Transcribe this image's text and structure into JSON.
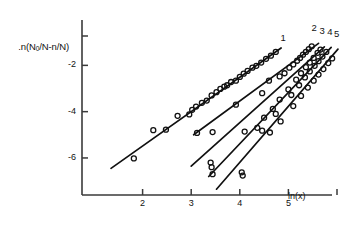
{
  "figure": {
    "background": "#ffffff",
    "ink": "#111111",
    "axis_color": "#3a3a3a"
  },
  "axes": {
    "y_axis_label": ".n(N₀/N-n/N)",
    "y_axis_label_parts": {
      "pre": ".n(N",
      "sub": "0",
      "post": "/N-n/N)"
    },
    "x_axis_label": "ln(x)",
    "y_ticks": [
      "-2",
      "-4",
      "-6"
    ],
    "x_ticks": [
      "2",
      "3",
      "4",
      "5"
    ],
    "xlim": [
      1.0,
      6.0
    ],
    "ylim": [
      -7.6,
      -0.3
    ]
  },
  "curve_labels": [
    "1",
    "2",
    "3",
    "4",
    "5"
  ],
  "chart_data": {
    "type": "scatter",
    "title": "",
    "xlabel": "ln(x)",
    "ylabel": ".n(N0/N-n/N)",
    "xlim": [
      1.0,
      6.0
    ],
    "ylim": [
      -7.6,
      -0.3
    ],
    "grid": false,
    "legend": "curve-end labels 1-5 at upper right",
    "marker": "open-circle",
    "series": [
      {
        "name": "1",
        "fit_line": {
          "x": [
            1.35,
            4.85
          ],
          "y": [
            -6.45,
            -1.25
          ],
          "slope": 1.486,
          "intercept": -8.456
        },
        "label_at": {
          "x": 4.92,
          "y": -0.85
        },
        "points": [
          {
            "x": 1.82,
            "y": -6.02
          },
          {
            "x": 2.22,
            "y": -4.8
          },
          {
            "x": 2.48,
            "y": -4.78
          },
          {
            "x": 2.72,
            "y": -4.18
          },
          {
            "x": 2.96,
            "y": -4.12
          },
          {
            "x": 3.02,
            "y": -3.92
          },
          {
            "x": 3.1,
            "y": -3.78
          },
          {
            "x": 3.22,
            "y": -3.62
          },
          {
            "x": 3.32,
            "y": -3.52
          },
          {
            "x": 3.42,
            "y": -3.3
          },
          {
            "x": 3.52,
            "y": -3.16
          },
          {
            "x": 3.6,
            "y": -3.02
          },
          {
            "x": 3.68,
            "y": -2.92
          },
          {
            "x": 3.74,
            "y": -2.86
          },
          {
            "x": 3.82,
            "y": -2.72
          },
          {
            "x": 3.92,
            "y": -2.66
          },
          {
            "x": 4.0,
            "y": -2.5
          },
          {
            "x": 4.08,
            "y": -2.36
          },
          {
            "x": 4.16,
            "y": -2.24
          },
          {
            "x": 4.26,
            "y": -2.1
          },
          {
            "x": 4.34,
            "y": -2.02
          },
          {
            "x": 4.44,
            "y": -1.88
          },
          {
            "x": 4.54,
            "y": -1.72
          },
          {
            "x": 4.64,
            "y": -1.58
          },
          {
            "x": 4.74,
            "y": -1.42
          }
        ]
      },
      {
        "name": "2",
        "fit_line": {
          "x": [
            3.05,
            5.62
          ],
          "y": [
            -5.0,
            -1.05
          ],
          "slope": 1.537,
          "intercept": -9.688
        },
        "label_at": {
          "x": 5.56,
          "y": -0.42
        },
        "points": [
          {
            "x": 3.12,
            "y": -4.92
          },
          {
            "x": 3.44,
            "y": -4.88
          },
          {
            "x": 3.92,
            "y": -3.7
          },
          {
            "x": 4.46,
            "y": -3.2
          },
          {
            "x": 4.6,
            "y": -2.66
          },
          {
            "x": 4.82,
            "y": -2.48
          },
          {
            "x": 4.92,
            "y": -2.34
          },
          {
            "x": 5.02,
            "y": -2.1
          },
          {
            "x": 5.1,
            "y": -1.96
          },
          {
            "x": 5.18,
            "y": -1.8
          },
          {
            "x": 5.24,
            "y": -1.68
          },
          {
            "x": 5.3,
            "y": -1.54
          },
          {
            "x": 5.36,
            "y": -1.42
          },
          {
            "x": 5.42,
            "y": -1.3
          },
          {
            "x": 5.48,
            "y": -1.18
          }
        ]
      },
      {
        "name": "3",
        "fit_line": {
          "x": [
            3.0,
            5.74
          ],
          "y": [
            -6.35,
            -1.2
          ],
          "slope": 1.88,
          "intercept": -11.99
        },
        "label_at": {
          "x": 5.72,
          "y": -0.58
        },
        "points": [
          {
            "x": 3.4,
            "y": -6.2
          },
          {
            "x": 3.42,
            "y": -6.4
          },
          {
            "x": 4.1,
            "y": -4.86
          },
          {
            "x": 4.36,
            "y": -4.7
          },
          {
            "x": 4.5,
            "y": -4.26
          },
          {
            "x": 4.68,
            "y": -3.88
          },
          {
            "x": 4.82,
            "y": -3.48
          },
          {
            "x": 5.0,
            "y": -3.04
          },
          {
            "x": 5.16,
            "y": -2.62
          },
          {
            "x": 5.26,
            "y": -2.34
          },
          {
            "x": 5.36,
            "y": -2.08
          },
          {
            "x": 5.44,
            "y": -1.88
          },
          {
            "x": 5.52,
            "y": -1.68
          },
          {
            "x": 5.6,
            "y": -1.46
          },
          {
            "x": 5.66,
            "y": -1.32
          }
        ]
      },
      {
        "name": "4",
        "fit_line": {
          "x": [
            3.36,
            5.88
          ],
          "y": [
            -6.8,
            -1.22
          ],
          "slope": 2.214,
          "intercept": -14.24
        },
        "label_at": {
          "x": 5.88,
          "y": -0.62
        },
        "points": [
          {
            "x": 3.44,
            "y": -6.7
          },
          {
            "x": 4.04,
            "y": -6.62
          },
          {
            "x": 4.46,
            "y": -4.82
          },
          {
            "x": 4.74,
            "y": -4.1
          },
          {
            "x": 5.06,
            "y": -3.28
          },
          {
            "x": 5.22,
            "y": -2.86
          },
          {
            "x": 5.34,
            "y": -2.52
          },
          {
            "x": 5.44,
            "y": -2.26
          },
          {
            "x": 5.54,
            "y": -2.02
          },
          {
            "x": 5.62,
            "y": -1.82
          },
          {
            "x": 5.7,
            "y": -1.62
          },
          {
            "x": 5.78,
            "y": -1.42
          }
        ]
      },
      {
        "name": "5",
        "fit_line": {
          "x": [
            3.52,
            6.02
          ],
          "y": [
            -7.35,
            -1.3
          ],
          "slope": 2.42,
          "intercept": -15.868
        },
        "label_at": {
          "x": 6.02,
          "y": -0.7
        },
        "points": [
          {
            "x": 4.06,
            "y": -6.76
          },
          {
            "x": 4.62,
            "y": -4.9
          },
          {
            "x": 4.84,
            "y": -4.42
          },
          {
            "x": 5.1,
            "y": -3.76
          },
          {
            "x": 5.26,
            "y": -3.32
          },
          {
            "x": 5.4,
            "y": -2.96
          },
          {
            "x": 5.52,
            "y": -2.66
          },
          {
            "x": 5.62,
            "y": -2.4
          },
          {
            "x": 5.72,
            "y": -2.16
          },
          {
            "x": 5.82,
            "y": -1.9
          },
          {
            "x": 5.9,
            "y": -1.7
          }
        ]
      }
    ]
  }
}
